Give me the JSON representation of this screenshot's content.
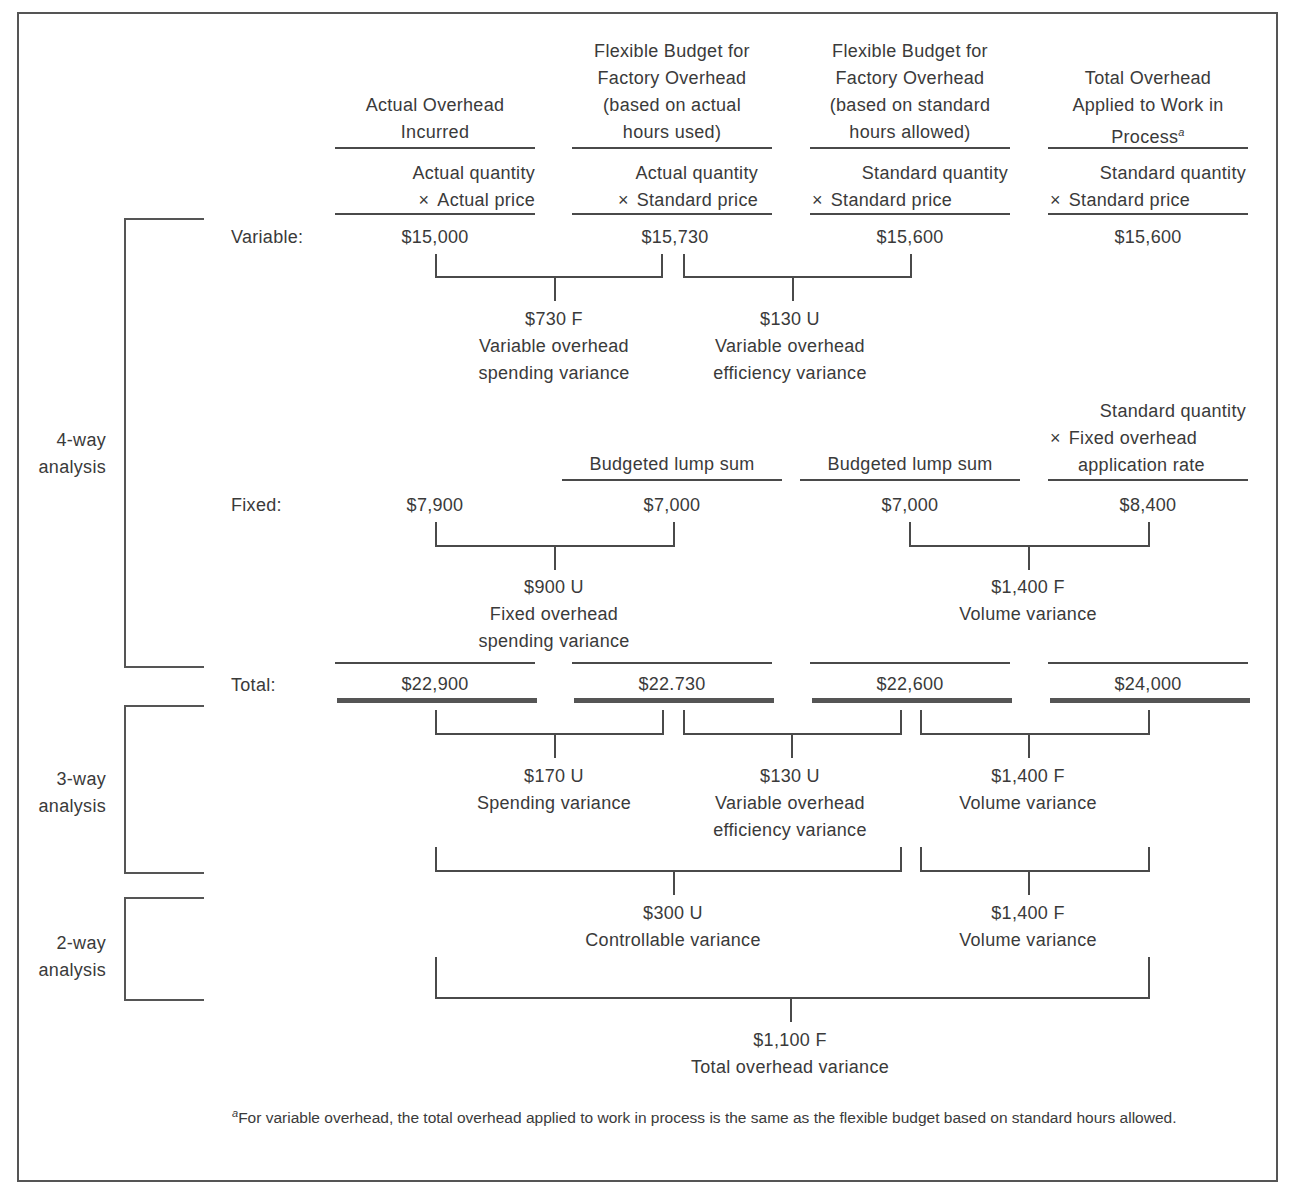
{
  "columns": [
    {
      "header": [
        "Actual Overhead",
        "Incurred"
      ],
      "formula": [
        "Actual quantity",
        "Actual price"
      ]
    },
    {
      "header": [
        "Flexible Budget for",
        "Factory Overhead",
        "(based on actual",
        "hours used)"
      ],
      "formula": [
        "Actual quantity",
        "Standard price"
      ]
    },
    {
      "header": [
        "Flexible Budget for",
        "Factory Overhead",
        "(based on standard",
        "hours allowed)"
      ],
      "formula": [
        "Standard quantity",
        "Standard price"
      ]
    },
    {
      "header": [
        "Total Overhead",
        "Applied to Work in",
        "Process"
      ],
      "header_footnote_mark": "a",
      "formula": [
        "Standard quantity",
        "Standard price"
      ]
    }
  ],
  "times_symbol": "×",
  "rows": {
    "variable": {
      "label": "Variable:",
      "values": [
        "$15,000",
        "$15,730",
        "$15,600",
        "$15,600"
      ]
    },
    "fixed": {
      "label": "Fixed:",
      "col_headers": [
        "",
        "Budgeted lump sum",
        "Budgeted lump sum",
        ""
      ],
      "col4_formula": [
        "Standard quantity",
        "Fixed overhead",
        "application rate"
      ],
      "values": [
        "$7,900",
        "$7,000",
        "$7,000",
        "$8,400"
      ]
    },
    "total": {
      "label": "Total:",
      "values": [
        "$22,900",
        "$22.730",
        "$22,600",
        "$24,000"
      ]
    }
  },
  "variances": {
    "four_way": [
      {
        "amount": "$730 F",
        "label": [
          "Variable overhead",
          "spending variance"
        ]
      },
      {
        "amount": "$130 U",
        "label": [
          "Variable overhead",
          "efficiency variance"
        ]
      },
      {
        "amount": "$900 U",
        "label": [
          "Fixed overhead",
          "spending variance"
        ]
      },
      {
        "amount": "$1,400 F",
        "label": [
          "Volume variance"
        ]
      }
    ],
    "three_way": [
      {
        "amount": "$170 U",
        "label": [
          "Spending variance"
        ]
      },
      {
        "amount": "$130 U",
        "label": [
          "Variable overhead",
          "efficiency variance"
        ]
      },
      {
        "amount": "$1,400 F",
        "label": [
          "Volume variance"
        ]
      }
    ],
    "two_way": [
      {
        "amount": "$300 U",
        "label": [
          "Controllable variance"
        ]
      },
      {
        "amount": "$1,400 F",
        "label": [
          "Volume variance"
        ]
      }
    ],
    "total": {
      "amount": "$1,100 F",
      "label": [
        "Total overhead variance"
      ]
    }
  },
  "analysis_labels": {
    "four_way": [
      "4-way",
      "analysis"
    ],
    "three_way": [
      "3-way",
      "analysis"
    ],
    "two_way": [
      "2-way",
      "analysis"
    ]
  },
  "footnote": {
    "mark": "a",
    "text": "For variable overhead, the total overhead applied to work in process is the same as the flexible budget based on standard hours allowed."
  }
}
